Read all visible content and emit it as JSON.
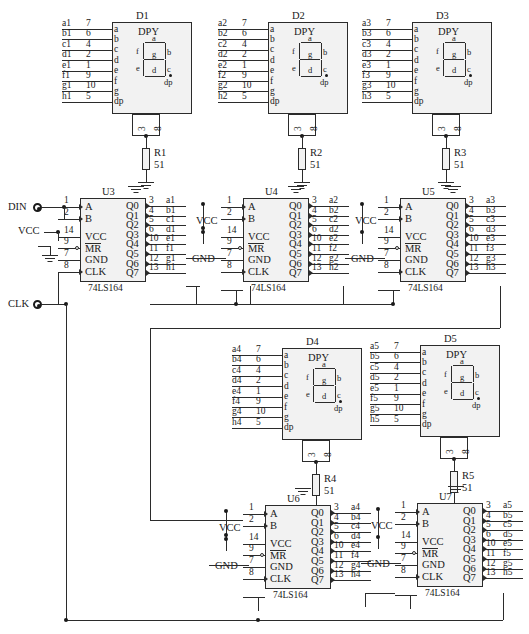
{
  "schematic": {
    "title": "74LS164 Serial Shift Register Seven-Segment Display Driver",
    "ic_type": "74LS164",
    "display_type": "DPY",
    "resistor_value": "51",
    "input_terminals": [
      {
        "name": "DIN",
        "label": "DIN"
      },
      {
        "name": "CLK",
        "label": "CLK"
      }
    ],
    "power_labels": {
      "vcc": "VCC",
      "gnd": "GND"
    },
    "display_pin_names": [
      "a",
      "b",
      "c",
      "d",
      "e",
      "f",
      "g",
      "dp"
    ],
    "display_pin_numbers": [
      "7",
      "6",
      "4",
      "2",
      "1",
      "9",
      "10",
      "5"
    ],
    "display_common_pins": [
      "3",
      "8"
    ],
    "ic_input_pins": [
      {
        "label": "A",
        "number": "1"
      },
      {
        "label": "B",
        "number": "2"
      },
      {
        "label": "VCC",
        "number": "14"
      },
      {
        "label": "MR",
        "number": "9"
      },
      {
        "label": "GND",
        "number": "7"
      },
      {
        "label": "CLK",
        "number": "8"
      }
    ],
    "ic_output_pins": [
      {
        "label": "Q0",
        "number": "3"
      },
      {
        "label": "Q1",
        "number": "4"
      },
      {
        "label": "Q2",
        "number": "5"
      },
      {
        "label": "Q3",
        "number": "6"
      },
      {
        "label": "Q4",
        "number": "10"
      },
      {
        "label": "Q5",
        "number": "11"
      },
      {
        "label": "Q6",
        "number": "12"
      },
      {
        "label": "Q7",
        "number": "13"
      }
    ],
    "segment_glyph_labels": [
      "a",
      "b",
      "c",
      "d",
      "e",
      "f",
      "g",
      "dp"
    ],
    "displays": [
      {
        "ref": "D1",
        "type": "DPY",
        "nets": [
          "a1",
          "b1",
          "c1",
          "d1",
          "e1",
          "f1",
          "g1",
          "h1"
        ]
      },
      {
        "ref": "D2",
        "type": "DPY",
        "nets": [
          "a2",
          "b2",
          "c2",
          "d2",
          "e2",
          "f2",
          "g2",
          "h2"
        ]
      },
      {
        "ref": "D3",
        "type": "DPY",
        "nets": [
          "a3",
          "b3",
          "c3",
          "d3",
          "e3",
          "f3",
          "g3",
          "h3"
        ]
      },
      {
        "ref": "D4",
        "type": "DPY",
        "nets": [
          "a4",
          "b4",
          "c4",
          "d4",
          "e4",
          "f4",
          "g4",
          "h4"
        ]
      },
      {
        "ref": "D5",
        "type": "DPY",
        "nets": [
          "a5",
          "b5",
          "c5",
          "d5",
          "e5",
          "f5",
          "g5",
          "h5"
        ]
      }
    ],
    "resistors": [
      {
        "ref": "R1",
        "value": "51"
      },
      {
        "ref": "R2",
        "value": "51"
      },
      {
        "ref": "R3",
        "value": "51"
      },
      {
        "ref": "R4",
        "value": "51"
      },
      {
        "ref": "R5",
        "value": "51"
      }
    ],
    "ics": [
      {
        "ref": "U3",
        "part": "74LS164",
        "nets": [
          "a1",
          "b1",
          "c1",
          "d1",
          "e1",
          "f1",
          "g1",
          "h1"
        ]
      },
      {
        "ref": "U4",
        "part": "74LS164",
        "nets": [
          "a2",
          "b2",
          "c2",
          "d2",
          "e2",
          "f2",
          "g2",
          "h2"
        ]
      },
      {
        "ref": "U5",
        "part": "74LS164",
        "nets": [
          "a3",
          "b3",
          "c3",
          "d3",
          "e3",
          "f3",
          "g3",
          "h3"
        ]
      },
      {
        "ref": "U6",
        "part": "74LS164",
        "nets": [
          "a4",
          "b4",
          "c4",
          "d4",
          "e4",
          "f4",
          "g4",
          "h4"
        ]
      },
      {
        "ref": "U7",
        "part": "74LS164",
        "nets": [
          "a5",
          "b5",
          "c5",
          "d5",
          "e5",
          "f5",
          "g5",
          "h5"
        ]
      }
    ]
  }
}
